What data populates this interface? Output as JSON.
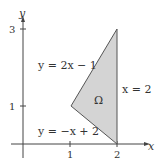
{
  "diagram": {
    "axes": {
      "x_label": "x",
      "y_label": "y"
    },
    "x_ticks": [
      "1",
      "2"
    ],
    "y_ticks": [
      "1",
      "3"
    ],
    "region_label": "Ω",
    "region_fill": "#d4d4d4",
    "curves": [
      {
        "label": "y = 2x − 1"
      },
      {
        "label": "x = 2"
      },
      {
        "label": "y = −x + 2"
      }
    ],
    "vertices": [
      [
        1,
        1
      ],
      [
        2,
        0
      ],
      [
        2,
        3
      ]
    ]
  }
}
